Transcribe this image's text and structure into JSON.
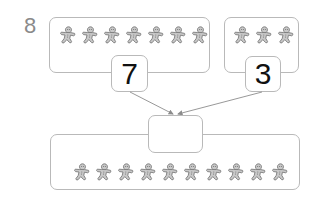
{
  "question_number": "8",
  "groups": [
    {
      "name": "left-group",
      "cookie_count": 7,
      "count_label": "7"
    },
    {
      "name": "right-group",
      "cookie_count": 3,
      "count_label": "3"
    }
  ],
  "total": {
    "cookie_count": 10,
    "answer_value": ""
  },
  "colors": {
    "border": "#b9b9b9",
    "cookie_fill": "#c8c8c8",
    "cookie_stroke": "#7a7a7a",
    "arrow": "#8c8c8c",
    "label": "#8a8a8a"
  }
}
